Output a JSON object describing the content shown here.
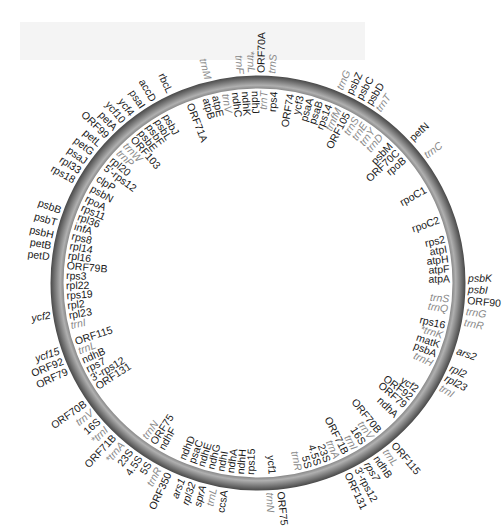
{
  "figure": {
    "type": "circular-genome-map",
    "colors": {
      "ring": "#6e6e6e",
      "ring_highlight": "#a8a8a8",
      "gene_text": "#1a1a1a",
      "trna_text": "#8a8a8a",
      "background": "#ffffff"
    },
    "ring": {
      "cx": 258,
      "cy": 283,
      "r_outer": 207,
      "r_inner": 195
    }
  },
  "outer_labels": [
    {
      "text": "trnS",
      "a": -86,
      "trna": true
    },
    {
      "text": "ORF70A",
      "a": -89,
      "trna": false
    },
    {
      "text": "*trnL",
      "a": -92,
      "trna": true
    },
    {
      "text": "trnF",
      "a": -95,
      "trna": true
    },
    {
      "text": "trnM",
      "a": -104,
      "trna": true
    },
    {
      "text": "rbcL",
      "a": -115,
      "trna": false
    },
    {
      "text": "accD",
      "a": -120,
      "trna": false
    },
    {
      "text": "psaI",
      "a": -123.5,
      "trna": false
    },
    {
      "text": "ycf4",
      "a": -127,
      "trna": false
    },
    {
      "text": "ycf10",
      "a": -130,
      "trna": false
    },
    {
      "text": "petA",
      "a": -133,
      "trna": false
    },
    {
      "text": "ORF99",
      "a": -136,
      "trna": false
    },
    {
      "text": "petL",
      "a": -139,
      "trna": false
    },
    {
      "text": "petG",
      "a": -142,
      "trna": false
    },
    {
      "text": "psaJ",
      "a": -145,
      "trna": false
    },
    {
      "text": "rpl33",
      "a": -148,
      "trna": false
    },
    {
      "text": "rps18",
      "a": -151,
      "trna": false
    },
    {
      "text": "psbB",
      "a": -160,
      "trna": false
    },
    {
      "text": "psbT",
      "a": -163.5,
      "trna": false
    },
    {
      "text": "psbH",
      "a": -167,
      "trna": false
    },
    {
      "text": "petB",
      "a": -170,
      "trna": false
    },
    {
      "text": "petD",
      "a": -173,
      "trna": false
    },
    {
      "text": "ycf2",
      "a": 171,
      "trna": false,
      "italic": true
    },
    {
      "text": "ycf15",
      "a": 161,
      "trna": false,
      "italic": true
    },
    {
      "text": "ORF92",
      "a": 158,
      "trna": false
    },
    {
      "text": "ORF79",
      "a": 155,
      "trna": false
    },
    {
      "text": "ORF70B",
      "a": 145,
      "trna": false
    },
    {
      "text": "trnV",
      "a": 142,
      "trna": true
    },
    {
      "text": "16S",
      "a": 139,
      "trna": false
    },
    {
      "text": "*trnI",
      "a": 136,
      "trna": true
    },
    {
      "text": "ORF71B",
      "a": 133,
      "trna": false
    },
    {
      "text": "*trnA",
      "a": 130,
      "trna": true
    },
    {
      "text": "23S",
      "a": 127,
      "trna": false
    },
    {
      "text": "4.5S",
      "a": 124,
      "trna": false
    },
    {
      "text": "5S",
      "a": 121,
      "trna": false
    },
    {
      "text": "trnR",
      "a": 118,
      "trna": true
    },
    {
      "text": "ORF350",
      "a": 115,
      "trna": false
    },
    {
      "text": "ars1",
      "a": 111,
      "trna": false,
      "italic": true
    },
    {
      "text": "rpl32",
      "a": 108,
      "trna": false,
      "italic": true
    },
    {
      "text": "sprA",
      "a": 105,
      "trna": false,
      "italic": true
    },
    {
      "text": "trnL",
      "a": 102,
      "trna": true
    },
    {
      "text": "ccsA",
      "a": 99,
      "trna": false
    },
    {
      "text": "trnN",
      "a": 87,
      "trna": true
    },
    {
      "text": "ORF75",
      "a": 84,
      "trna": false
    },
    {
      "text": "ORF131",
      "a": 65,
      "trna": false
    },
    {
      "text": "3'-rps12",
      "a": 62,
      "trna": false
    },
    {
      "text": "rps7",
      "a": 59,
      "trna": false,
      "italic": true
    },
    {
      "text": "ndhB",
      "a": 56,
      "trna": false
    },
    {
      "text": "trnL",
      "a": 53,
      "trna": true
    },
    {
      "text": "ORF115",
      "a": 50,
      "trna": false
    },
    {
      "text": "trnI",
      "a": 30,
      "trna": true
    },
    {
      "text": "rpl23",
      "a": 27,
      "trna": false,
      "italic": true
    },
    {
      "text": "rpl2",
      "a": 24,
      "trna": false,
      "italic": true
    },
    {
      "text": "psbK",
      "a": -1,
      "trna": false,
      "italic": true
    },
    {
      "text": "psbI",
      "a": 2,
      "trna": false,
      "italic": true
    },
    {
      "text": "ORF90",
      "a": 5,
      "trna": false
    },
    {
      "text": "trnG",
      "a": 8,
      "trna": true
    },
    {
      "text": "trnR",
      "a": 11,
      "trna": true
    },
    {
      "text": "ars2",
      "a": 19,
      "trna": false,
      "italic": true
    },
    {
      "text": "trnC",
      "a": -37,
      "trna": true
    },
    {
      "text": "petN",
      "a": -43,
      "trna": false
    },
    {
      "text": "trnT",
      "a": -55,
      "trna": true
    },
    {
      "text": "psbD",
      "a": -58,
      "trna": false
    },
    {
      "text": "psbC",
      "a": -61,
      "trna": false
    },
    {
      "text": "psbZ",
      "a": -64,
      "trna": false
    },
    {
      "text": "trnG",
      "a": -67,
      "trna": true
    }
  ],
  "inner_labels": [
    {
      "text": "rps4",
      "a": -85,
      "trna": false
    },
    {
      "text": "trnT",
      "a": -88,
      "trna": true
    },
    {
      "text": "ndhJ",
      "a": -91,
      "trna": false
    },
    {
      "text": "ndhK",
      "a": -94,
      "trna": false
    },
    {
      "text": "ndhC",
      "a": -97,
      "trna": false
    },
    {
      "text": "trnV",
      "a": -100,
      "trna": true
    },
    {
      "text": "atpE",
      "a": -103,
      "trna": false
    },
    {
      "text": "atpB",
      "a": -106,
      "trna": false
    },
    {
      "text": "ORF71A",
      "a": -111,
      "trna": false
    },
    {
      "text": "psbJ",
      "a": -119,
      "trna": false
    },
    {
      "text": "psbL",
      "a": -122,
      "trna": false
    },
    {
      "text": "psbF",
      "a": -125,
      "trna": false
    },
    {
      "text": "psbE",
      "a": -128,
      "trna": false
    },
    {
      "text": "ORF103",
      "a": -131,
      "trna": false
    },
    {
      "text": "trnW",
      "a": -134,
      "trna": true
    },
    {
      "text": "trnP",
      "a": -137,
      "trna": true
    },
    {
      "text": "rpl20",
      "a": -140,
      "trna": false
    },
    {
      "text": "5'-rps12",
      "a": -143,
      "trna": false
    },
    {
      "text": "clpP",
      "a": -147,
      "trna": false
    },
    {
      "text": "psbN",
      "a": -150.5,
      "trna": false
    },
    {
      "text": "rpoA",
      "a": -154,
      "trna": false
    },
    {
      "text": "rps11",
      "a": -157,
      "trna": false
    },
    {
      "text": "rpl36",
      "a": -160,
      "trna": false
    },
    {
      "text": "infA",
      "a": -163,
      "trna": false
    },
    {
      "text": "rps8",
      "a": -166,
      "trna": false
    },
    {
      "text": "rpl14",
      "a": -169,
      "trna": false
    },
    {
      "text": "rpl16",
      "a": -172,
      "trna": false
    },
    {
      "text": "ORF79B",
      "a": -175,
      "trna": false
    },
    {
      "text": "rps3",
      "a": -178,
      "trna": false
    },
    {
      "text": "rpl22",
      "a": 179,
      "trna": false
    },
    {
      "text": "rps19",
      "a": 176,
      "trna": false
    },
    {
      "text": "rpl2",
      "a": 173,
      "trna": false
    },
    {
      "text": "rpl23",
      "a": 170,
      "trna": false
    },
    {
      "text": "trnI",
      "a": 167,
      "trna": true
    },
    {
      "text": "ORF115",
      "a": 162,
      "trna": false
    },
    {
      "text": "trnL",
      "a": 159,
      "trna": true
    },
    {
      "text": "ndhB",
      "a": 156,
      "trna": false
    },
    {
      "text": "rps7",
      "a": 153,
      "trna": false
    },
    {
      "text": "3'-rps12",
      "a": 150,
      "trna": false
    },
    {
      "text": "ORF131",
      "a": 147,
      "trna": false
    },
    {
      "text": "trnN",
      "a": 126,
      "trna": true
    },
    {
      "text": "ORF75",
      "a": 123,
      "trna": false
    },
    {
      "text": "ndhF",
      "a": 120,
      "trna": false
    },
    {
      "text": "ndhD",
      "a": 113,
      "trna": false
    },
    {
      "text": "psaC",
      "a": 110,
      "trna": false
    },
    {
      "text": "ndhE",
      "a": 107,
      "trna": false
    },
    {
      "text": "ndhG",
      "a": 104,
      "trna": false
    },
    {
      "text": "ndhI",
      "a": 101,
      "trna": false
    },
    {
      "text": "ndhA",
      "a": 98,
      "trna": false
    },
    {
      "text": "ndhH",
      "a": 95,
      "trna": false
    },
    {
      "text": "rps15",
      "a": 92,
      "trna": false
    },
    {
      "text": "ycf1",
      "a": 86,
      "trna": false
    },
    {
      "text": "trnR",
      "a": 78,
      "trna": true
    },
    {
      "text": "5S",
      "a": 75,
      "trna": false
    },
    {
      "text": "4.5S",
      "a": 72,
      "trna": false
    },
    {
      "text": "23S",
      "a": 69,
      "trna": false
    },
    {
      "text": "trnA",
      "a": 66,
      "trna": true
    },
    {
      "text": "ORF71B",
      "a": 63,
      "trna": false
    },
    {
      "text": "trnI",
      "a": 60,
      "trna": true
    },
    {
      "text": "16S",
      "a": 57,
      "trna": false
    },
    {
      "text": "trnV",
      "a": 54,
      "trna": true
    },
    {
      "text": "ORF70B",
      "a": 51,
      "trna": false
    },
    {
      "text": "ndhA",
      "a": 44,
      "trna": false
    },
    {
      "text": "ORF79",
      "a": 40,
      "trna": false
    },
    {
      "text": "ORF92",
      "a": 37,
      "trna": false
    },
    {
      "text": "ycf2",
      "a": 34,
      "trna": false
    },
    {
      "text": "trnH",
      "a": 25,
      "trna": true
    },
    {
      "text": "psbA",
      "a": 22,
      "trna": false
    },
    {
      "text": "matK",
      "a": 19,
      "trna": false
    },
    {
      "text": "*trnK",
      "a": 16,
      "trna": true
    },
    {
      "text": "rps16",
      "a": 13,
      "trna": false
    },
    {
      "text": "trnQ",
      "a": 8,
      "trna": true
    },
    {
      "text": "trnS",
      "a": 5,
      "trna": true
    },
    {
      "text": "atpA",
      "a": -1,
      "trna": false
    },
    {
      "text": "atpF",
      "a": -4,
      "trna": false
    },
    {
      "text": "atpH",
      "a": -7,
      "trna": false
    },
    {
      "text": "atpI",
      "a": -10,
      "trna": false
    },
    {
      "text": "rps2",
      "a": -13,
      "trna": false
    },
    {
      "text": "rpoC2",
      "a": -19,
      "trna": false
    },
    {
      "text": "rpoC1",
      "a": -29,
      "trna": false
    },
    {
      "text": "rpoB",
      "a": -40,
      "trna": false
    },
    {
      "text": "ORF70C",
      "a": -43,
      "trna": false
    },
    {
      "text": "psbM",
      "a": -46,
      "trna": false
    },
    {
      "text": "trnD",
      "a": -50,
      "trna": true
    },
    {
      "text": "trnY",
      "a": -53,
      "trna": true
    },
    {
      "text": "trnE",
      "a": -56,
      "trna": true
    },
    {
      "text": "trnS",
      "a": -59,
      "trna": true
    },
    {
      "text": "ORF105",
      "a": -62,
      "trna": false
    },
    {
      "text": "trnfM",
      "a": -65,
      "trna": true
    },
    {
      "text": "rps14",
      "a": -68,
      "trna": false
    },
    {
      "text": "psaB",
      "a": -71,
      "trna": false
    },
    {
      "text": "psaA",
      "a": -74,
      "trna": false
    },
    {
      "text": "ycf3",
      "a": -77,
      "trna": false
    },
    {
      "text": "ORF74",
      "a": -80,
      "trna": false
    }
  ]
}
